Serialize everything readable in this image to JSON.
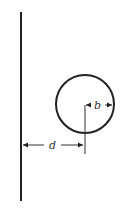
{
  "diagram": {
    "labels": {
      "radius": "b",
      "distance": "d"
    },
    "colors": {
      "stroke": "#222222",
      "background": "#ffffff"
    },
    "geometry": {
      "wall": {
        "x": 21,
        "y1": 12,
        "y2": 201
      },
      "circle": {
        "cx": 85,
        "cy": 104,
        "r": 29
      },
      "distance_arrow": {
        "y": 145,
        "x1": 23,
        "x2": 84
      },
      "radius_arrow": {
        "y": 105,
        "x1": 85,
        "x2": 113
      }
    }
  }
}
